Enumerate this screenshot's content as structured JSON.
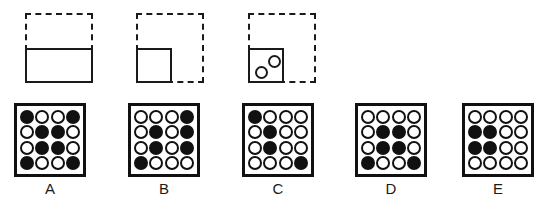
{
  "figure": {
    "kind": "matrix-reasoning-answer-choices",
    "colors": {
      "ink": "#1a1a1a",
      "grid_ink": "#111111",
      "background": "#ffffff"
    }
  },
  "prompt_row": {
    "items": [
      {
        "name": "shape-wide-rectangle",
        "dashed_frame": true,
        "solid_part": "bottom-half-wide-rectangle",
        "dots_inside": 0
      },
      {
        "name": "shape-small-square",
        "dashed_frame": true,
        "solid_part": "bottom-left-small-square",
        "dots_inside": 0
      },
      {
        "name": "shape-small-square-with-dots",
        "dashed_frame": true,
        "solid_part": "bottom-left-small-square",
        "dots_inside": 2
      }
    ]
  },
  "answers": {
    "columns": 4,
    "rows": 4,
    "legend": {
      "filled": "filled",
      "open": "open"
    },
    "options": [
      {
        "label": "A",
        "grid": [
          [
            "filled",
            "open",
            "open",
            "filled"
          ],
          [
            "open",
            "filled",
            "filled",
            "open"
          ],
          [
            "open",
            "filled",
            "filled",
            "open"
          ],
          [
            "filled",
            "open",
            "open",
            "filled"
          ]
        ]
      },
      {
        "label": "B",
        "grid": [
          [
            "open",
            "open",
            "open",
            "filled"
          ],
          [
            "open",
            "filled",
            "open",
            "filled"
          ],
          [
            "open",
            "filled",
            "open",
            "filled"
          ],
          [
            "filled",
            "open",
            "open",
            "open"
          ]
        ]
      },
      {
        "label": "C",
        "grid": [
          [
            "filled",
            "open",
            "open",
            "open"
          ],
          [
            "open",
            "filled",
            "open",
            "open"
          ],
          [
            "open",
            "filled",
            "open",
            "open"
          ],
          [
            "open",
            "open",
            "open",
            "filled"
          ]
        ]
      },
      {
        "label": "D",
        "grid": [
          [
            "open",
            "open",
            "open",
            "open"
          ],
          [
            "open",
            "filled",
            "filled",
            "open"
          ],
          [
            "open",
            "filled",
            "filled",
            "open"
          ],
          [
            "filled",
            "open",
            "open",
            "filled"
          ]
        ]
      },
      {
        "label": "E",
        "grid": [
          [
            "open",
            "open",
            "open",
            "open"
          ],
          [
            "filled",
            "filled",
            "open",
            "open"
          ],
          [
            "filled",
            "filled",
            "open",
            "open"
          ],
          [
            "open",
            "open",
            "open",
            "open"
          ]
        ]
      }
    ]
  }
}
